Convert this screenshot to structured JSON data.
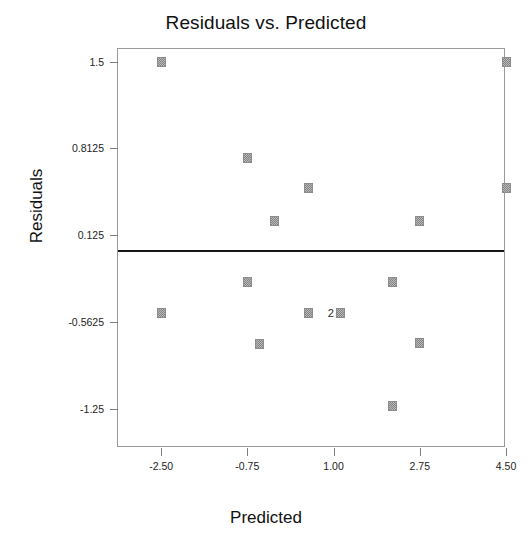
{
  "chart_data": {
    "type": "scatter",
    "title": "Residuals vs. Predicted",
    "xlabel": "Predicted",
    "ylabel": "Residuals",
    "xlim": [
      -3.375,
      4.5
    ],
    "ylim": [
      -1.5625,
      1.6
    ],
    "grid": false,
    "legend": null,
    "xticks": [
      -2.5,
      -0.75,
      1.0,
      2.75,
      4.5
    ],
    "xtick_labels": [
      "-2.50",
      "-0.75",
      "1.00",
      "2.75",
      "4.50"
    ],
    "yticks": [
      1.5,
      0.8125,
      0.125,
      -0.5625,
      -1.25
    ],
    "ytick_labels": [
      "1.5",
      "0.8125",
      "0.125",
      "-0.5625",
      "-1.25"
    ],
    "reference_line": {
      "orientation": "horizontal",
      "y": 0.0
    },
    "points": [
      {
        "x": -2.5,
        "y": 1.5,
        "label": ""
      },
      {
        "x": 4.5,
        "y": 1.5,
        "label": ""
      },
      {
        "x": -0.75,
        "y": 0.74,
        "label": ""
      },
      {
        "x": 0.5,
        "y": 0.5,
        "label": ""
      },
      {
        "x": 4.5,
        "y": 0.5,
        "label": ""
      },
      {
        "x": -0.2,
        "y": 0.24,
        "label": ""
      },
      {
        "x": 2.75,
        "y": 0.24,
        "label": ""
      },
      {
        "x": -0.75,
        "y": -0.25,
        "label": ""
      },
      {
        "x": 2.2,
        "y": -0.25,
        "label": ""
      },
      {
        "x": -2.5,
        "y": -0.49,
        "label": ""
      },
      {
        "x": 0.5,
        "y": -0.49,
        "label": ""
      },
      {
        "x": 1.15,
        "y": -0.49,
        "label": "2"
      },
      {
        "x": -0.5,
        "y": -0.74,
        "label": ""
      },
      {
        "x": 2.75,
        "y": -0.73,
        "label": ""
      },
      {
        "x": 2.2,
        "y": -1.23,
        "label": ""
      }
    ],
    "overlap_annotations": [
      {
        "x": 1.15,
        "y": -0.49,
        "count": "2"
      }
    ]
  }
}
